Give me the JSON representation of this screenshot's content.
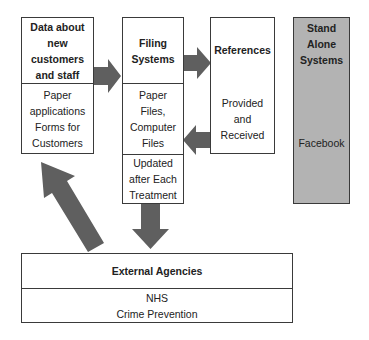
{
  "diagram": {
    "colors": {
      "border": "#3a3a3a",
      "arrow": "#5f5f5f",
      "standalone_fill": "#b3b3b3",
      "box_fill": "#ffffff"
    },
    "boxes": {
      "data_customers": {
        "title_lines": [
          "Data about",
          "new",
          "customers",
          "and staff"
        ],
        "body_lines": [
          "Paper",
          "applications",
          "Forms for",
          "Customers"
        ]
      },
      "filing_systems": {
        "title_lines": [
          "Filing",
          "Systems"
        ],
        "body_lines": [
          "Paper",
          "Files,",
          "Computer",
          "Files"
        ],
        "footer_lines": [
          "Updated",
          "after Each",
          "Treatment"
        ]
      },
      "references": {
        "title_lines": [
          "References"
        ],
        "body_lines": [
          "Provided",
          "and",
          "Received"
        ]
      },
      "standalone": {
        "title_lines": [
          "Stand",
          "Alone",
          "Systems"
        ],
        "body_lines": [
          "Facebook"
        ]
      },
      "external_agencies": {
        "title_lines": [
          "External Agencies"
        ],
        "body_lines": [
          "NHS",
          "Crime Prevention"
        ]
      }
    },
    "arrows": [
      {
        "from": "data_customers",
        "to": "filing_systems",
        "direction": "right"
      },
      {
        "from": "filing_systems",
        "to": "references",
        "direction": "right"
      },
      {
        "from": "references",
        "to": "filing_systems",
        "direction": "left"
      },
      {
        "from": "filing_systems",
        "to": "external_agencies",
        "direction": "down"
      },
      {
        "from": "external_agencies",
        "to": "data_customers",
        "direction": "up-left"
      }
    ]
  }
}
